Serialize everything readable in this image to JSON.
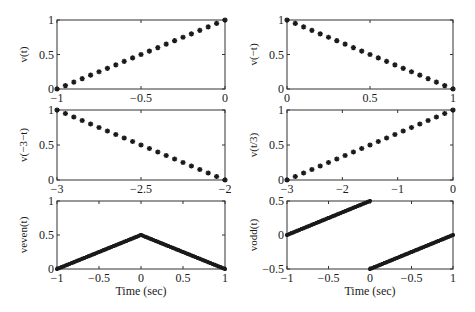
{
  "chart_data": [
    {
      "type": "scatter",
      "id": "p1",
      "ylabel": "v(t)",
      "xlabel": "",
      "xlim": [
        -1,
        0
      ],
      "ylim": [
        0,
        1
      ],
      "xticks": [
        -1,
        -0.5,
        0
      ],
      "xtick_labels": [
        "−1",
        "−0.5",
        "0"
      ],
      "yticks": [
        0,
        0.5,
        1
      ],
      "ytick_labels": [
        "0",
        "0.5",
        "1"
      ],
      "marker": "star",
      "segments": [
        {
          "x": [
            -1,
            0
          ],
          "y": [
            0,
            1
          ],
          "n": 21
        }
      ]
    },
    {
      "type": "scatter",
      "id": "p2",
      "ylabel": "v(−t)",
      "xlabel": "",
      "xlim": [
        0,
        1
      ],
      "ylim": [
        0,
        1
      ],
      "xticks": [
        0,
        0.5,
        1
      ],
      "xtick_labels": [
        "0",
        "0.5",
        "1"
      ],
      "yticks": [
        0,
        0.5,
        1
      ],
      "ytick_labels": [
        "0",
        "0.5",
        "1"
      ],
      "marker": "star",
      "segments": [
        {
          "x": [
            0,
            1
          ],
          "y": [
            1,
            0
          ],
          "n": 21
        }
      ]
    },
    {
      "type": "scatter",
      "id": "p3",
      "ylabel": "v(−3−t)",
      "xlabel": "",
      "xlim": [
        -3,
        -2
      ],
      "ylim": [
        0,
        1
      ],
      "xticks": [
        -3,
        -2.5,
        -2
      ],
      "xtick_labels": [
        "−3",
        "−2.5",
        "−2"
      ],
      "yticks": [
        0,
        0.5,
        1
      ],
      "ytick_labels": [
        "0",
        "0.5",
        "1"
      ],
      "marker": "star",
      "segments": [
        {
          "x": [
            -3,
            -2
          ],
          "y": [
            1,
            0
          ],
          "n": 21
        }
      ]
    },
    {
      "type": "scatter",
      "id": "p4",
      "ylabel": "v(t/3)",
      "xlabel": "",
      "xlim": [
        -3,
        0
      ],
      "ylim": [
        0,
        1
      ],
      "xticks": [
        -3,
        -2,
        -1,
        0
      ],
      "xtick_labels": [
        "−3",
        "−2",
        "−1",
        "0"
      ],
      "yticks": [
        0,
        0.5,
        1
      ],
      "ytick_labels": [
        "0",
        "0.5",
        "1"
      ],
      "marker": "star",
      "segments": [
        {
          "x": [
            -3,
            0
          ],
          "y": [
            0,
            1
          ],
          "n": 21
        }
      ]
    },
    {
      "type": "line",
      "id": "p5",
      "ylabel": "veven(t)",
      "xlabel": "Time (sec)",
      "xlim": [
        -1,
        1
      ],
      "ylim": [
        0,
        1
      ],
      "xticks": [
        -1,
        -0.5,
        0,
        0.5,
        1
      ],
      "xtick_labels": [
        "−1",
        "−0.5",
        "0",
        "0.5",
        "1"
      ],
      "yticks": [
        0,
        0.5,
        1
      ],
      "ytick_labels": [
        "0",
        "0.5",
        "1"
      ],
      "marker": "dense-star",
      "segments": [
        {
          "x": [
            -1,
            0
          ],
          "y": [
            0,
            0.5
          ],
          "n": 41
        },
        {
          "x": [
            0,
            1
          ],
          "y": [
            0.5,
            0
          ],
          "n": 41
        }
      ]
    },
    {
      "type": "line",
      "id": "p6",
      "ylabel": "vodd(t)",
      "xlabel": "Time (sec)",
      "xlim": [
        -1,
        1
      ],
      "ylim": [
        -0.5,
        0.5
      ],
      "xticks": [
        -1,
        -0.5,
        0,
        0.5,
        1
      ],
      "xtick_labels": [
        "−1",
        "−0.5",
        "0",
        "−0.5",
        "1"
      ],
      "yticks": [
        -0.5,
        0,
        0.5
      ],
      "ytick_labels": [
        "−0.5",
        "0",
        "0.5"
      ],
      "marker": "dense-star",
      "segments": [
        {
          "x": [
            -1,
            0
          ],
          "y": [
            0,
            0.5
          ],
          "n": 41
        },
        {
          "x": [
            0,
            1
          ],
          "y": [
            -0.5,
            0
          ],
          "n": 41
        }
      ]
    }
  ]
}
